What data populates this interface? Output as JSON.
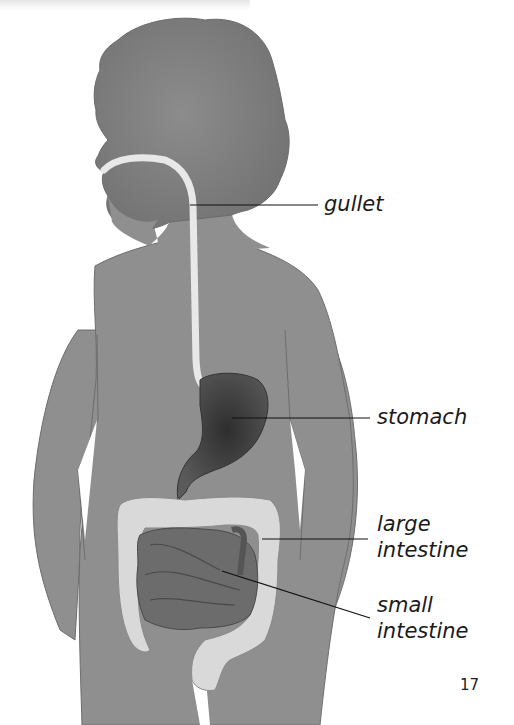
{
  "figure": {
    "labels": {
      "gullet": "gullet",
      "stomach": "stomach",
      "large_intestine_line1": "large",
      "large_intestine_line2": "intestine",
      "small_intestine_line1": "small",
      "small_intestine_line2": "intestine"
    },
    "colors": {
      "body": "#8f8f8f",
      "body_outline": "#6e6e6e",
      "gullet": "#e8e8e8",
      "stomach": "#3f3f3f",
      "large_intestine": "#d9d9d9",
      "small_intestine": "#6c6c6c",
      "leader_line": "#111111"
    }
  },
  "page": {
    "number": "17"
  }
}
